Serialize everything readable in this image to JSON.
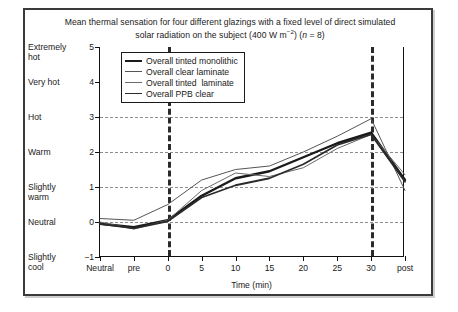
{
  "figure": {
    "title_line1": "Mean thermal sensation for four different glazings with a fixed level of direct simulated",
    "title_line2_a": "solar radiation on the subject (400 W m",
    "title_line2_sup": "−2",
    "title_line2_b": ") (",
    "title_line2_n": "n",
    "title_line2_c": " = 8)",
    "border_color": "#3a3a3a"
  },
  "legend": {
    "position": "inside-top-left",
    "entries": [
      {
        "label": "Overall tinted monolithic",
        "color": "#1a1a1a",
        "width": 2.4
      },
      {
        "label": "Overall clear laminate",
        "color": "#555555",
        "width": 1.0
      },
      {
        "label": "Overall tinted  laminate",
        "color": "#6a6a6a",
        "width": 1.0
      },
      {
        "label": "Overall PPB clear",
        "color": "#2b2b2b",
        "width": 1.8
      }
    ]
  },
  "chart_data": {
    "type": "line",
    "title": "Mean thermal sensation for four different glazings with a fixed level of direct simulated solar radiation on the subject (400 W m−2) (n = 8)",
    "xlabel": "Time (min)",
    "ylabel": "",
    "grid": true,
    "x_categories": [
      "Neutral",
      "pre",
      "0",
      "5",
      "10",
      "15",
      "20",
      "25",
      "30",
      "post"
    ],
    "ylim": [
      -1,
      5
    ],
    "yticks": [
      {
        "value": 5,
        "num": "5",
        "label": "Extremely\nhot"
      },
      {
        "value": 4,
        "num": "4",
        "label": "Very hot"
      },
      {
        "value": 3,
        "num": "3",
        "label": "Hot"
      },
      {
        "value": 2,
        "num": "2",
        "label": "Warm"
      },
      {
        "value": 1,
        "num": "1",
        "label": "Slightly\nwarm"
      },
      {
        "value": 0,
        "num": "0",
        "label": "Neutral"
      },
      {
        "value": -1,
        "num": "−1",
        "label": "Slightly\ncool"
      }
    ],
    "ylabel_texts": [
      "Extremely hot",
      "Very hot",
      "Hot",
      "Warm",
      "Slightly warm",
      "Neutral",
      "Slightly cool"
    ],
    "gridline_values": [
      3,
      2,
      1,
      0
    ],
    "vertical_markers": [
      {
        "at": "0",
        "label": "exposure start"
      },
      {
        "at": "30",
        "label": "exposure end"
      }
    ],
    "series": [
      {
        "name": "Overall tinted monolithic",
        "color": "#1a1a1a",
        "width": 2.4,
        "values": [
          -0.05,
          -0.15,
          0.05,
          0.75,
          1.25,
          1.45,
          1.85,
          2.25,
          2.55,
          1.2
        ]
      },
      {
        "name": "Overall clear laminate",
        "color": "#555555",
        "width": 1.0,
        "values": [
          0.1,
          0.05,
          0.5,
          1.2,
          1.5,
          1.6,
          2.0,
          2.45,
          2.95,
          0.9
        ]
      },
      {
        "name": "Overall tinted  laminate",
        "color": "#6a6a6a",
        "width": 1.0,
        "values": [
          0.0,
          -0.2,
          0.05,
          0.9,
          1.4,
          1.3,
          1.55,
          2.1,
          2.5,
          1.35
        ]
      },
      {
        "name": "Overall PPB clear",
        "color": "#2b2b2b",
        "width": 1.8,
        "values": [
          -0.05,
          -0.18,
          0.02,
          0.7,
          1.05,
          1.25,
          1.65,
          2.2,
          2.5,
          1.15
        ]
      }
    ]
  }
}
